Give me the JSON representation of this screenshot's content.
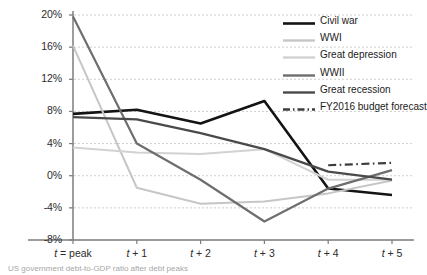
{
  "chart_data": {
    "type": "line",
    "title": "",
    "xlabel": "",
    "ylabel": "",
    "categories": [
      "t = peak",
      "t + 1",
      "t + 2",
      "t + 3",
      "t + 4",
      "t + 5"
    ],
    "ylim": [
      -8,
      20
    ],
    "yticks": [
      20,
      16,
      12,
      8,
      4,
      0,
      -4,
      -8
    ],
    "ytick_labels": [
      "20%",
      "16%",
      "12%",
      "8%",
      "4%",
      "0%",
      "-4%",
      "-8%"
    ],
    "grid": true,
    "grid_style": "dashed-horizontal",
    "legend_position": "top-right",
    "series": [
      {
        "name": "Civil war",
        "color": "#141414",
        "width": 2.6,
        "dash": "none",
        "values": [
          7.7,
          8.2,
          6.5,
          9.3,
          -1.6,
          -2.4
        ]
      },
      {
        "name": "WWI",
        "color": "#c6c6c6",
        "width": 2.0,
        "dash": "none",
        "values": [
          16.2,
          -1.5,
          -3.5,
          -3.2,
          -2.2,
          -0.6
        ]
      },
      {
        "name": "Great depression",
        "color": "#d2d2d2",
        "width": 2.0,
        "dash": "none",
        "values": [
          3.5,
          2.9,
          2.7,
          3.3,
          -0.5,
          -0.5
        ]
      },
      {
        "name": "WWII",
        "color": "#6e6e6e",
        "width": 2.2,
        "dash": "none",
        "values": [
          19.8,
          4.0,
          -0.5,
          -5.7,
          -1.6,
          0.7
        ]
      },
      {
        "name": "Great recession",
        "color": "#4a4a4a",
        "width": 2.3,
        "dash": "none",
        "values": [
          7.3,
          7.0,
          5.3,
          3.3,
          0.5,
          -0.5
        ]
      },
      {
        "name": "FY2016 budget forecast",
        "color": "#3c3c3c",
        "width": 2.2,
        "dash": "dashdot",
        "values": [
          null,
          null,
          null,
          null,
          1.3,
          1.6
        ]
      }
    ]
  },
  "axis": {
    "x_labels": [
      {
        "italic": "t",
        "rest": " = peak"
      },
      {
        "italic": "t",
        "rest": " + 1"
      },
      {
        "italic": "t",
        "rest": " + 2"
      },
      {
        "italic": "t",
        "rest": " + 3"
      },
      {
        "italic": "t",
        "rest": " + 4"
      },
      {
        "italic": "t",
        "rest": " + 5"
      }
    ]
  },
  "caption": {
    "text": "US government debt-to-GDP ratio after debt peaks"
  },
  "colors": {
    "axis": "#7d7d7d",
    "grid": "#c9c9c9",
    "text": "#1a1a1a"
  }
}
